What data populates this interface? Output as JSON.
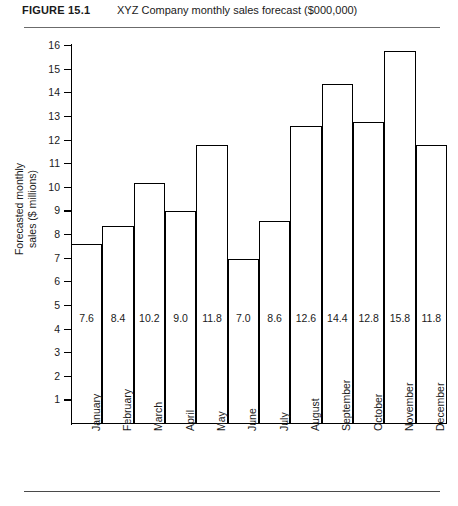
{
  "figure": {
    "number": "FIGURE 15.1",
    "caption": "XYZ Company monthly sales forecast ($000,000)"
  },
  "chart_data": {
    "type": "bar",
    "title": "XYZ Company monthly sales forecast ($000,000)",
    "xlabel": "",
    "ylabel": "Forecasted monthly sales ($ millions)",
    "ylabel_line1": "Forecasted monthly",
    "ylabel_line2": "sales ($ millions)",
    "categories": [
      "January",
      "February",
      "March",
      "April",
      "May",
      "June",
      "July",
      "August",
      "September",
      "October",
      "November",
      "December"
    ],
    "values": [
      7.6,
      8.4,
      10.2,
      9.0,
      11.8,
      7.0,
      8.6,
      12.6,
      14.4,
      12.8,
      15.8,
      11.8
    ],
    "value_labels": [
      "7.6",
      "8.4",
      "10.2",
      "9.0",
      "11.8",
      "7.0",
      "8.6",
      "12.6",
      "14.4",
      "12.8",
      "15.8",
      "11.8"
    ],
    "ylim": [
      0,
      16
    ],
    "yticks": [
      16,
      15,
      14,
      13,
      12,
      11,
      10,
      9,
      8,
      7,
      6,
      5,
      4,
      3,
      2,
      1
    ],
    "ytick_labels": [
      "16",
      "15",
      "14",
      "13",
      "12",
      "11",
      "10",
      "9",
      "8",
      "7",
      "6",
      "5",
      "4",
      "3",
      "2",
      "1"
    ],
    "grid": false,
    "legend": null,
    "bar_fill": "#ffffff",
    "bar_outline": "#000000"
  }
}
